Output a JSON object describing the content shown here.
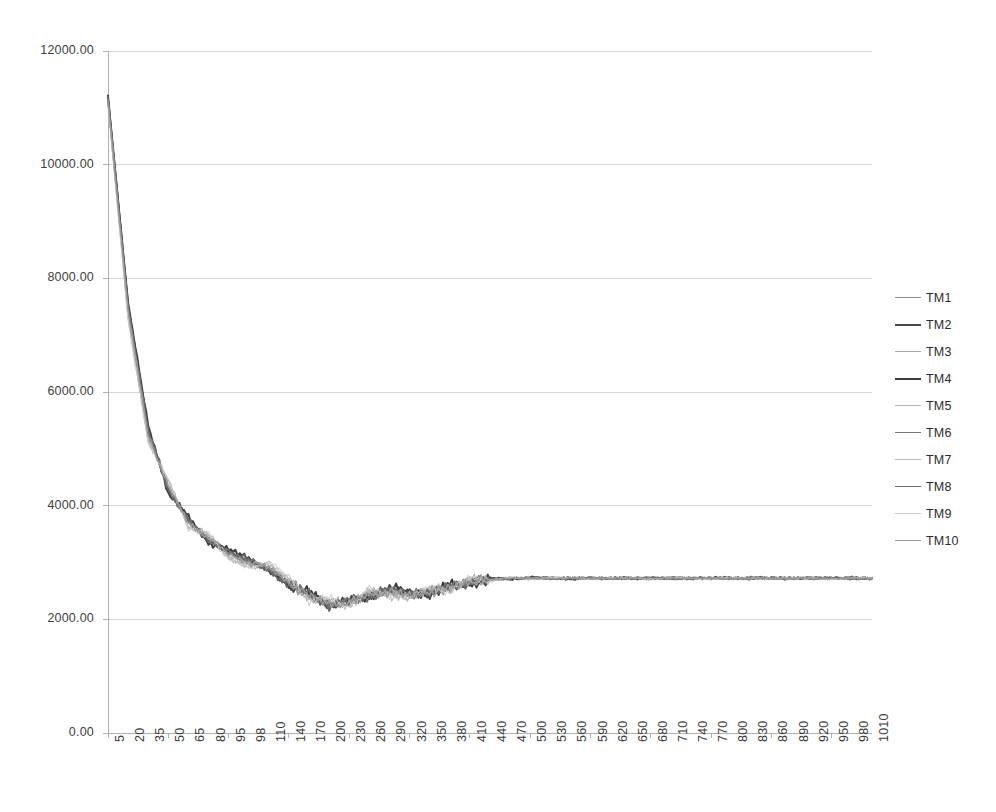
{
  "chart_data": {
    "type": "line",
    "title": "",
    "subtitle": "",
    "xlabel": "",
    "ylabel": "",
    "grid": true,
    "legend_position": "right",
    "ylim": [
      0,
      12000
    ],
    "ytick_labels": [
      "12000.00",
      "10000.00",
      "8000.00",
      "6000.00",
      "4000.00",
      "2000.00",
      "0.00"
    ],
    "ytick_values": [
      12000,
      10000,
      8000,
      6000,
      4000,
      2000,
      0
    ],
    "categories": [
      "5",
      "20",
      "35",
      "50",
      "65",
      "80",
      "95",
      "98",
      "110",
      "140",
      "170",
      "200",
      "230",
      "260",
      "290",
      "320",
      "350",
      "380",
      "410",
      "440",
      "470",
      "500",
      "530",
      "560",
      "590",
      "620",
      "650",
      "680",
      "710",
      "740",
      "770",
      "800",
      "830",
      "860",
      "890",
      "920",
      "950",
      "980",
      "1010"
    ],
    "x_axis_note": "category axis, labels rotated 90 degrees",
    "series": [
      {
        "name": "TM1",
        "color": "#8f8f8f",
        "width": 1.5,
        "values": [
          11150,
          7450,
          5280,
          4310,
          3720,
          3420,
          3160,
          3010,
          2900,
          2640,
          2420,
          2270,
          2300,
          2430,
          2500,
          2430,
          2480,
          2560,
          2660,
          2700,
          2720,
          2730,
          2720,
          2730,
          2720,
          2730,
          2725,
          2720,
          2730,
          2725,
          2720,
          2730,
          2725,
          2720,
          2730,
          2725,
          2720,
          2730,
          2725
        ]
      },
      {
        "name": "TM2",
        "color": "#4a4a4a",
        "width": 2.0,
        "values": [
          11180,
          7520,
          5340,
          4260,
          3760,
          3380,
          3200,
          3050,
          2870,
          2610,
          2460,
          2240,
          2320,
          2400,
          2530,
          2450,
          2460,
          2590,
          2640,
          2710,
          2715,
          2725,
          2730,
          2720,
          2725,
          2720,
          2730,
          2725,
          2720,
          2730,
          2720,
          2725,
          2730,
          2725,
          2720,
          2730,
          2725,
          2720,
          2730
        ]
      },
      {
        "name": "TM3",
        "color": "#a8a8a8",
        "width": 1.2,
        "values": [
          11120,
          7380,
          5200,
          4380,
          3680,
          3460,
          3120,
          2980,
          2930,
          2670,
          2390,
          2300,
          2270,
          2460,
          2470,
          2410,
          2510,
          2540,
          2680,
          2690,
          2730,
          2720,
          2715,
          2725,
          2730,
          2720,
          2720,
          2730,
          2725,
          2715,
          2730,
          2720,
          2725,
          2730,
          2720,
          2725,
          2730,
          2725,
          2720
        ]
      },
      {
        "name": "TM4",
        "color": "#3d3d3d",
        "width": 2.0,
        "values": [
          11200,
          7560,
          5400,
          4230,
          3800,
          3350,
          3230,
          3080,
          2840,
          2590,
          2480,
          2220,
          2340,
          2380,
          2550,
          2470,
          2440,
          2610,
          2620,
          2720,
          2710,
          2730,
          2725,
          2715,
          2720,
          2730,
          2715,
          2720,
          2730,
          2720,
          2725,
          2730,
          2720,
          2725,
          2730,
          2720,
          2725,
          2730,
          2720
        ]
      },
      {
        "name": "TM5",
        "color": "#b5b5b5",
        "width": 1.2,
        "values": [
          11100,
          7320,
          5160,
          4420,
          3640,
          3490,
          3090,
          2950,
          2960,
          2700,
          2360,
          2330,
          2250,
          2490,
          2450,
          2390,
          2530,
          2520,
          2700,
          2680,
          2735,
          2715,
          2720,
          2730,
          2715,
          2725,
          2730,
          2715,
          2720,
          2735,
          2720,
          2715,
          2730,
          2720,
          2725,
          2730,
          2715,
          2720,
          2730
        ]
      },
      {
        "name": "TM6",
        "color": "#767676",
        "width": 1.6,
        "values": [
          11160,
          7480,
          5300,
          4290,
          3740,
          3400,
          3180,
          3020,
          2890,
          2630,
          2430,
          2260,
          2310,
          2420,
          2510,
          2440,
          2470,
          2570,
          2650,
          2705,
          2720,
          2725,
          2730,
          2720,
          2730,
          2715,
          2725,
          2730,
          2715,
          2725,
          2730,
          2720,
          2715,
          2730,
          2720,
          2725,
          2730,
          2715,
          2725
        ]
      },
      {
        "name": "TM7",
        "color": "#bdbdbd",
        "width": 1.1,
        "values": [
          11080,
          7280,
          5120,
          4450,
          3600,
          3510,
          3060,
          2930,
          2980,
          2720,
          2340,
          2350,
          2240,
          2510,
          2430,
          2380,
          2550,
          2500,
          2710,
          2675,
          2740,
          2710,
          2725,
          2735,
          2710,
          2730,
          2725,
          2710,
          2735,
          2720,
          2715,
          2730,
          2725,
          2715,
          2730,
          2720,
          2710,
          2730,
          2725
        ]
      },
      {
        "name": "TM8",
        "color": "#6b6b6b",
        "width": 1.6,
        "values": [
          11170,
          7500,
          5320,
          4270,
          3770,
          3370,
          3210,
          3040,
          2860,
          2600,
          2470,
          2230,
          2330,
          2390,
          2540,
          2460,
          2450,
          2600,
          2630,
          2715,
          2712,
          2728,
          2722,
          2718,
          2728,
          2722,
          2718,
          2728,
          2722,
          2718,
          2728,
          2722,
          2718,
          2728,
          2722,
          2718,
          2728,
          2722,
          2718
        ]
      },
      {
        "name": "TM9",
        "color": "#cbcbcb",
        "width": 1.0,
        "values": [
          11060,
          7250,
          5090,
          4480,
          3570,
          3530,
          3040,
          2910,
          3000,
          2740,
          2320,
          2370,
          2230,
          2530,
          2410,
          2370,
          2570,
          2490,
          2720,
          2665,
          2745,
          2705,
          2730,
          2740,
          2705,
          2735,
          2720,
          2705,
          2740,
          2715,
          2710,
          2735,
          2720,
          2710,
          2735,
          2715,
          2705,
          2735,
          2720
        ]
      },
      {
        "name": "TM10",
        "color": "#9b9b9b",
        "width": 1.4,
        "values": [
          11140,
          7420,
          5250,
          4330,
          3700,
          3440,
          3140,
          2995,
          2910,
          2655,
          2405,
          2285,
          2285,
          2445,
          2490,
          2420,
          2495,
          2550,
          2670,
          2695,
          2725,
          2722,
          2718,
          2728,
          2722,
          2718,
          2728,
          2722,
          2718,
          2728,
          2722,
          2718,
          2728,
          2722,
          2718,
          2728,
          2722,
          2718,
          2728
        ]
      }
    ]
  },
  "legend": {
    "items": [
      {
        "label": "TM1"
      },
      {
        "label": "TM2"
      },
      {
        "label": "TM3"
      },
      {
        "label": "TM4"
      },
      {
        "label": "TM5"
      },
      {
        "label": "TM6"
      },
      {
        "label": "TM7"
      },
      {
        "label": "TM8"
      },
      {
        "label": "TM9"
      },
      {
        "label": "TM10"
      }
    ]
  },
  "colors": {
    "gridline": "#d6d6d6",
    "axis": "#b0b0b0",
    "text": "#3a3a3a",
    "background": "#ffffff"
  }
}
